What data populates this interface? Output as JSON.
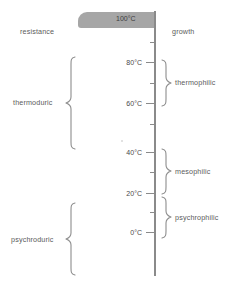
{
  "diagram": {
    "title_left": "resistance",
    "title_right": "growth",
    "bar_label": "100°C",
    "axis": {
      "unit": "°C",
      "min": -10,
      "max": 100,
      "major_ticks": [
        "80°C",
        "60°C",
        "40°C",
        "20°C",
        "0°C"
      ],
      "major_tick_values": [
        80,
        60,
        40,
        20,
        0
      ],
      "minor_tick_values": [
        90,
        70,
        50,
        30,
        10,
        -10
      ]
    },
    "left_groups": [
      {
        "label": "thermoduric",
        "range": "60–100°C"
      },
      {
        "label": "psychroduric",
        "range": "0– below 20°C"
      }
    ],
    "right_groups": [
      {
        "label": "thermophilic",
        "range": "60–80°C"
      },
      {
        "label": "mesophilic",
        "range": "20–40°C"
      },
      {
        "label": "psychrophilic",
        "range": "0–20°C"
      }
    ],
    "colors": {
      "bar": "#a6a6a6",
      "axis": "#8a8a8a",
      "text": "#5b5b5b",
      "background": "#ffffff"
    }
  }
}
